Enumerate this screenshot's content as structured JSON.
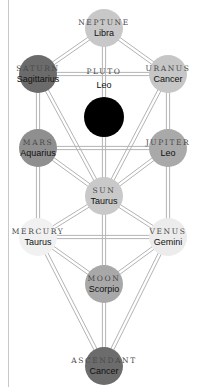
{
  "diagram": {
    "title": "",
    "nodes": [
      {
        "id": "neptune",
        "planet": "NEPTUNE",
        "sign": "Libra",
        "x": 104,
        "y": 28,
        "r": 19,
        "fill": "#c8c8c8"
      },
      {
        "id": "saturn",
        "planet": "SATURN",
        "sign": "Sagittarius",
        "x": 38,
        "y": 74,
        "r": 19,
        "fill": "#6b6b6b"
      },
      {
        "id": "uranus",
        "planet": "URANUS",
        "sign": "Cancer",
        "x": 168,
        "y": 74,
        "r": 19,
        "fill": "#c6c6c6"
      },
      {
        "id": "pluto",
        "planet": "PLUTO",
        "sign": "Leo",
        "x": 104,
        "y": 117,
        "r": 20,
        "fill": "#000000",
        "label_above": true
      },
      {
        "id": "mars",
        "planet": "MARS",
        "sign": "Aquarius",
        "x": 38,
        "y": 148,
        "r": 19,
        "fill": "#8f8f8f"
      },
      {
        "id": "jupiter",
        "planet": "JUPITER",
        "sign": "Leo",
        "x": 168,
        "y": 148,
        "r": 19,
        "fill": "#a9a9a9"
      },
      {
        "id": "sun",
        "planet": "SUN",
        "sign": "Taurus",
        "x": 104,
        "y": 196,
        "r": 19,
        "fill": "#c9c9c9"
      },
      {
        "id": "mercury",
        "planet": "MERCURY",
        "sign": "Taurus",
        "x": 38,
        "y": 237,
        "r": 19,
        "fill": "#f1f1f1"
      },
      {
        "id": "venus",
        "planet": "VENUS",
        "sign": "Gemini",
        "x": 168,
        "y": 237,
        "r": 19,
        "fill": "#ececec"
      },
      {
        "id": "moon",
        "planet": "MOON",
        "sign": "Scorpio",
        "x": 104,
        "y": 284,
        "r": 19,
        "fill": "#a8a8a8"
      },
      {
        "id": "ascendant",
        "planet": "ASCENDANT",
        "sign": "Cancer",
        "x": 104,
        "y": 366,
        "r": 19,
        "fill": "#6c6c6c"
      }
    ],
    "edges": [
      [
        "neptune",
        "saturn"
      ],
      [
        "neptune",
        "uranus"
      ],
      [
        "neptune",
        "sun"
      ],
      [
        "saturn",
        "uranus"
      ],
      [
        "saturn",
        "mars"
      ],
      [
        "saturn",
        "sun"
      ],
      [
        "uranus",
        "jupiter"
      ],
      [
        "uranus",
        "sun"
      ],
      [
        "mars",
        "jupiter"
      ],
      [
        "mars",
        "sun"
      ],
      [
        "mars",
        "mercury"
      ],
      [
        "jupiter",
        "sun"
      ],
      [
        "jupiter",
        "venus"
      ],
      [
        "sun",
        "mercury"
      ],
      [
        "sun",
        "venus"
      ],
      [
        "sun",
        "moon"
      ],
      [
        "mercury",
        "venus"
      ],
      [
        "mercury",
        "moon"
      ],
      [
        "mercury",
        "ascendant"
      ],
      [
        "venus",
        "moon"
      ],
      [
        "venus",
        "ascendant"
      ],
      [
        "moon",
        "ascendant"
      ]
    ],
    "colors": {
      "edge": "#b4b4b4",
      "background": "#ffffff",
      "border": "#c8c8c8"
    }
  }
}
